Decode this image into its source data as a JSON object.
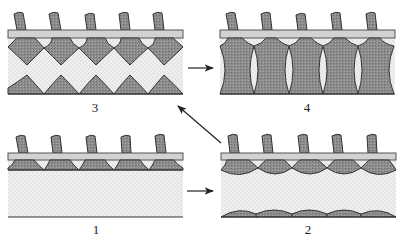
{
  "figure": {
    "panels": [
      {
        "id": "3",
        "label": "3",
        "stage": "diamond-shaped masses from top meeting triangular masses from bottom"
      },
      {
        "id": "4",
        "label": "4",
        "stage": "columns fused top-to-bottom with lens-shaped gaps"
      },
      {
        "id": "1",
        "label": "1",
        "stage": "shallow cup-shaped masses under bar"
      },
      {
        "id": "2",
        "label": "2",
        "stage": "rounded caps under bar and low domes on bottom"
      }
    ],
    "arrows": [
      {
        "from": "1",
        "to": "2",
        "direction": "right"
      },
      {
        "from": "2",
        "to": "3",
        "direction": "up-left"
      },
      {
        "from": "3",
        "to": "4",
        "direction": "right"
      }
    ]
  },
  "colors": {
    "dark_fill": "#8a8a8a",
    "bar_fill": "#cfcfcf",
    "stipple_bg": "#ececec",
    "stroke": "#333333"
  }
}
